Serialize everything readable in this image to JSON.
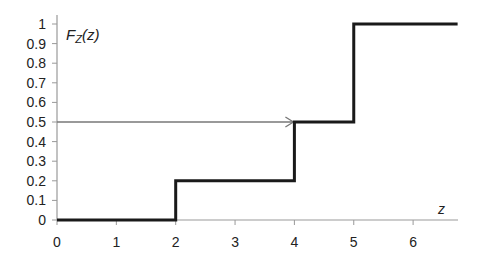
{
  "chart_data": {
    "type": "line",
    "subtype": "step (cumulative distribution function)",
    "title": "",
    "ylabel": "F_Z(z)",
    "ylabel_display": {
      "main": "F",
      "sub": "Z",
      "rest": "(z)"
    },
    "xlabel": "z",
    "xlim": [
      0,
      6.75
    ],
    "ylim": [
      0,
      1
    ],
    "x_ticks": [
      0,
      1,
      2,
      3,
      4,
      5,
      6
    ],
    "y_ticks": [
      0,
      0.1,
      0.2,
      0.3,
      0.4,
      0.5,
      0.6,
      0.7,
      0.8,
      0.9,
      1
    ],
    "y_tick_labels": [
      "0",
      "0.1",
      "0.2",
      "0.3",
      "0.4",
      "0.5",
      "0.6",
      "0.7",
      "0.8",
      "0.9",
      "1"
    ],
    "grid": false,
    "legend": null,
    "series": [
      {
        "name": "F_Z(z)",
        "step_points": [
          {
            "x": 0,
            "y": 0
          },
          {
            "x": 2,
            "y": 0
          },
          {
            "x": 2,
            "y": 0.2
          },
          {
            "x": 4,
            "y": 0.2
          },
          {
            "x": 4,
            "y": 0.5
          },
          {
            "x": 5,
            "y": 0.5
          },
          {
            "x": 5,
            "y": 1
          },
          {
            "x": 6.75,
            "y": 1
          }
        ],
        "color": "#1a1a1a"
      }
    ],
    "annotations": [
      {
        "type": "arrow",
        "from": {
          "x": 0,
          "y": 0.5
        },
        "to": {
          "x": 4,
          "y": 0.5
        },
        "color": "#777777",
        "description": "horizontal arrow at F=0.5 pointing to z=4 (median)"
      }
    ]
  }
}
